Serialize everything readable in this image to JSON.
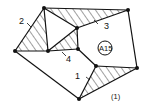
{
  "figure": {
    "caption": "(1)",
    "region_label": "A15",
    "labels": [
      {
        "id": "1",
        "text": "1"
      },
      {
        "id": "2",
        "text": "2"
      },
      {
        "id": "3",
        "text": "3"
      },
      {
        "id": "4",
        "text": "4"
      }
    ],
    "nodes": [
      {
        "id": "a",
        "x": 44,
        "y": 8
      },
      {
        "id": "b",
        "x": 128,
        "y": 10
      },
      {
        "id": "c",
        "x": 15,
        "y": 51
      },
      {
        "id": "d",
        "x": 77,
        "y": 28
      },
      {
        "id": "e",
        "x": 48,
        "y": 51
      },
      {
        "id": "f",
        "x": 78,
        "y": 49
      },
      {
        "id": "g",
        "x": 96,
        "y": 66
      },
      {
        "id": "h",
        "x": 137,
        "y": 68
      },
      {
        "id": "i",
        "x": 79,
        "y": 99
      }
    ],
    "hatched_regions": [
      "triangle a-c-e (2)",
      "triangle a-b-d (3)",
      "triangle e-d-f (4)",
      "triangle g-h-i (1)"
    ]
  }
}
